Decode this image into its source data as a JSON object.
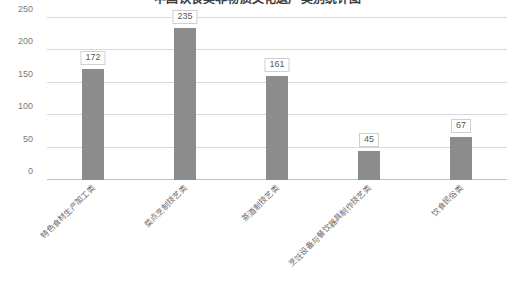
{
  "chart_data": {
    "type": "bar",
    "title": "中国饮食类非物质文化遗产类别统计图",
    "xlabel": "",
    "ylabel": "",
    "categories": [
      "特色食材生产加工类",
      "菜点烹制技艺类",
      "茶酒制技艺类",
      "烹饪设备与餐饮器具制作技艺类",
      "饮食民俗类"
    ],
    "values": [
      172,
      235,
      161,
      45,
      67
    ],
    "value_labels": [
      "172",
      "235",
      "161",
      "45",
      "67"
    ],
    "ylim": [
      0,
      250
    ],
    "yticks": [
      0,
      50,
      100,
      150,
      200,
      250
    ],
    "ytick_labels": [
      "0",
      "50",
      "100",
      "150",
      "200",
      "250"
    ],
    "grid": true,
    "legend": false,
    "bar_color": "#8c8c8c",
    "gridline_color": "#d9d9d9",
    "background_color": "#ffffff"
  }
}
